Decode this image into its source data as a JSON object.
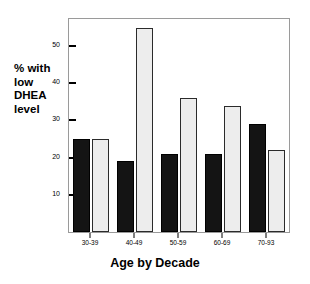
{
  "chart_data": {
    "type": "bar",
    "title": "",
    "xlabel": "Age by Decade",
    "ylabel": "% with low DHEA level",
    "ylabel_lines": [
      "% with",
      "low",
      "DHEA",
      "level"
    ],
    "categories": [
      "30-39",
      "40-49",
      "50-59",
      "60-69",
      "70-93"
    ],
    "series": [
      {
        "name": "dark",
        "color": "#141414",
        "values": [
          25,
          19,
          21,
          21,
          29
        ]
      },
      {
        "name": "light",
        "color": "#ededed",
        "values": [
          25,
          55,
          36,
          34,
          22
        ]
      }
    ],
    "ylim": [
      0,
      57.3
    ],
    "yticks": [
      10,
      20,
      30,
      40,
      50
    ],
    "ytick_labels": [
      "10",
      "20",
      "30",
      "40",
      "50"
    ],
    "grid": false,
    "legend": "none",
    "frame": true
  },
  "colors": {
    "dark_bar": "#141414",
    "light_bar": "#ededed",
    "bar_outline": "#2b2b2b",
    "frame": "#9a9a9a",
    "text": "#000000",
    "background": "#ffffff"
  }
}
